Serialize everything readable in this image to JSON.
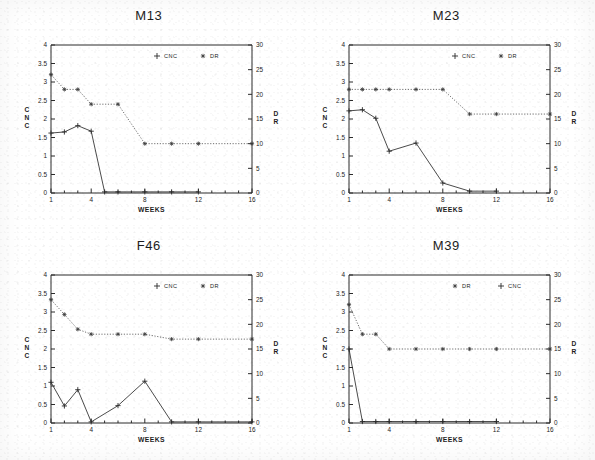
{
  "figure": {
    "panel_count": 4,
    "axis": {
      "x_label": "WEEKS",
      "x_min": 1,
      "x_max": 16,
      "x_tick_labels": [
        "1",
        "4",
        "8",
        "12",
        "16"
      ],
      "x_tick_values": [
        1,
        4,
        8,
        12,
        16
      ],
      "y_left_label": "CNC",
      "y_left_min": 0,
      "y_left_max": 4,
      "y_left_tick_labels": [
        "0",
        "0.5",
        "1",
        "1.5",
        "2",
        "2.5",
        "3",
        "3.5",
        "4"
      ],
      "y_right_label": "DR",
      "y_right_min": 0,
      "y_right_max": 30,
      "y_right_tick_labels": [
        "0",
        "5",
        "10",
        "15",
        "20",
        "25",
        "30"
      ]
    },
    "legend_labels": {
      "cnc": "CNC",
      "dr": "DR"
    },
    "marker_icon_cnc": "plus-marker-icon",
    "marker_icon_dr": "star-marker-icon",
    "colors": {
      "cnc": "#2b2b2b",
      "dr": "#4a4a4a",
      "axis": "#2b2b2b",
      "background": "#ffffff"
    }
  },
  "chart_data": [
    {
      "type": "line",
      "title": "M13",
      "xlabel": "WEEKS",
      "ylabel": "CNC",
      "y2label": "DR",
      "xlim": [
        1,
        16
      ],
      "ylim": [
        0,
        4
      ],
      "y2lim": [
        0,
        30
      ],
      "grid": false,
      "legend_position": "top-right",
      "legend_order": [
        "CNC",
        "DR"
      ],
      "series": [
        {
          "name": "CNC",
          "axis": "left",
          "marker": "plus",
          "linestyle": "solid",
          "x": [
            1,
            2,
            3,
            4,
            5,
            6,
            8,
            10,
            12
          ],
          "values": [
            1.62,
            1.65,
            1.82,
            1.67,
            0.03,
            0.03,
            0.03,
            0.03,
            0.03
          ]
        },
        {
          "name": "DR",
          "axis": "right",
          "marker": "star",
          "linestyle": "dotted",
          "x": [
            1,
            2,
            3,
            4,
            6,
            8,
            10,
            12,
            16
          ],
          "values": [
            24.0,
            21.0,
            21.0,
            18.0,
            18.0,
            10.0,
            10.0,
            10.0,
            10.0
          ]
        }
      ]
    },
    {
      "type": "line",
      "title": "M23",
      "xlabel": "WEEKS",
      "ylabel": "CNC",
      "y2label": "DR",
      "xlim": [
        1,
        16
      ],
      "ylim": [
        0,
        4
      ],
      "y2lim": [
        0,
        30
      ],
      "grid": false,
      "legend_position": "top-right",
      "legend_order": [
        "CNC",
        "DR"
      ],
      "series": [
        {
          "name": "CNC",
          "axis": "left",
          "marker": "plus",
          "linestyle": "solid",
          "x": [
            1,
            2,
            3,
            4,
            6,
            8,
            10,
            12
          ],
          "values": [
            2.22,
            2.25,
            2.02,
            1.13,
            1.35,
            0.27,
            0.05,
            0.05
          ]
        },
        {
          "name": "DR",
          "axis": "right",
          "marker": "star",
          "linestyle": "dotted",
          "x": [
            1,
            2,
            3,
            4,
            6,
            8,
            10,
            12,
            16
          ],
          "values": [
            21.0,
            21.0,
            21.0,
            21.0,
            21.0,
            21.0,
            16.0,
            16.0,
            16.0
          ]
        }
      ]
    },
    {
      "type": "line",
      "title": "F46",
      "xlabel": "WEEKS",
      "ylabel": "CNC",
      "y2label": "DR",
      "xlim": [
        1,
        16
      ],
      "ylim": [
        0,
        4
      ],
      "y2lim": [
        0,
        30
      ],
      "grid": false,
      "legend_position": "top-right",
      "legend_order": [
        "CNC",
        "DR"
      ],
      "series": [
        {
          "name": "CNC",
          "axis": "left",
          "marker": "plus",
          "linestyle": "solid",
          "x": [
            1,
            2,
            3,
            4,
            6,
            8,
            10,
            12,
            16
          ],
          "values": [
            1.1,
            0.46,
            0.9,
            0.03,
            0.47,
            1.13,
            0.03,
            0.03,
            0.03
          ]
        },
        {
          "name": "DR",
          "axis": "right",
          "marker": "star",
          "linestyle": "dotted",
          "x": [
            1,
            2,
            3,
            4,
            6,
            8,
            10,
            12,
            16
          ],
          "values": [
            25.0,
            22.0,
            19.0,
            18.0,
            18.0,
            18.0,
            17.0,
            17.0,
            17.0
          ]
        }
      ]
    },
    {
      "type": "line",
      "title": "M39",
      "xlabel": "WEEKS",
      "ylabel": "CNC",
      "y2label": "DR",
      "xlim": [
        1,
        16
      ],
      "ylim": [
        0,
        4
      ],
      "y2lim": [
        0,
        30
      ],
      "grid": false,
      "legend_position": "top-right",
      "legend_order": [
        "DR",
        "CNC"
      ],
      "series": [
        {
          "name": "CNC",
          "axis": "left",
          "marker": "plus",
          "linestyle": "solid",
          "x": [
            1,
            2,
            3,
            4,
            6,
            8,
            10,
            12
          ],
          "values": [
            2.0,
            0.04,
            0.04,
            0.04,
            0.04,
            0.04,
            0.04,
            0.04
          ]
        },
        {
          "name": "DR",
          "axis": "right",
          "marker": "star",
          "linestyle": "dotted",
          "x": [
            1,
            2,
            3,
            4,
            6,
            8,
            10,
            12,
            16
          ],
          "values": [
            24.0,
            18.0,
            18.0,
            15.0,
            15.0,
            15.0,
            15.0,
            15.0,
            15.0
          ]
        }
      ]
    }
  ]
}
